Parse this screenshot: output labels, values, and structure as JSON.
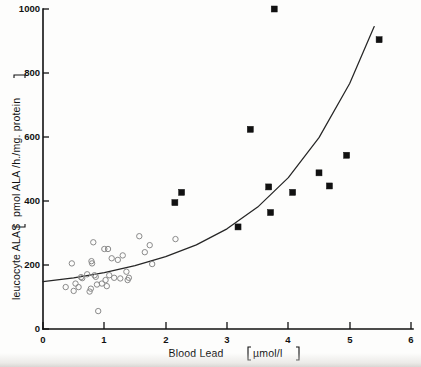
{
  "chart_data": {
    "type": "scatter",
    "title": "",
    "xlabel": "Blood Lead [ µmol/l ]",
    "xlabel_main": "Blood  Lead",
    "xlabel_unit": "µmol/l",
    "ylabel": "leucocyte ALAS [ pmol ALA /h./mg. protein ]",
    "ylabel_main": "leucocyte ALAS",
    "ylabel_unit": "pmol  ALA /h./mg. protein",
    "xlim": [
      0,
      6
    ],
    "ylim": [
      0,
      1000
    ],
    "xticks": [
      0,
      1,
      2,
      3,
      4,
      5,
      6
    ],
    "xticklabels": [
      "0",
      "1",
      "2",
      "3",
      "4",
      "5",
      "6"
    ],
    "yticks": [
      0,
      200,
      400,
      600,
      800,
      1000
    ],
    "yticklabels": [
      "0",
      "200",
      "400",
      "600",
      "800",
      "1000"
    ],
    "grid": false,
    "legend": "none",
    "marker_colors": {
      "open_circle_stroke": "#8a8a8a",
      "filled_square": "#111111",
      "curve": "#262626",
      "axis": "#111111"
    },
    "series": [
      {
        "name": "controls (open circles)",
        "marker": "open-circle",
        "points": [
          [
            0.37,
            131
          ],
          [
            0.47,
            205
          ],
          [
            0.5,
            119
          ],
          [
            0.53,
            142
          ],
          [
            0.58,
            131
          ],
          [
            0.62,
            162
          ],
          [
            0.64,
            159
          ],
          [
            0.72,
            171
          ],
          [
            0.76,
            117
          ],
          [
            0.78,
            126
          ],
          [
            0.79,
            212
          ],
          [
            0.8,
            205
          ],
          [
            0.82,
            271
          ],
          [
            0.84,
            168
          ],
          [
            0.86,
            163
          ],
          [
            0.88,
            139
          ],
          [
            0.9,
            56
          ],
          [
            0.96,
            142
          ],
          [
            1.0,
            250
          ],
          [
            1.02,
            153
          ],
          [
            1.04,
            134
          ],
          [
            1.06,
            250
          ],
          [
            1.08,
            168
          ],
          [
            1.12,
            221
          ],
          [
            1.16,
            160
          ],
          [
            1.22,
            216
          ],
          [
            1.26,
            158
          ],
          [
            1.3,
            230
          ],
          [
            1.36,
            179
          ],
          [
            1.38,
            153
          ],
          [
            1.4,
            160
          ],
          [
            1.57,
            290
          ],
          [
            1.66,
            240
          ],
          [
            1.74,
            262
          ],
          [
            1.78,
            203
          ],
          [
            2.16,
            281
          ]
        ]
      },
      {
        "name": "lead-exposed (filled squares)",
        "marker": "filled-square",
        "points": [
          [
            2.15,
            395
          ],
          [
            2.26,
            427
          ],
          [
            3.18,
            319
          ],
          [
            3.38,
            624
          ],
          [
            3.68,
            444
          ],
          [
            3.71,
            364
          ],
          [
            3.77,
            1000
          ],
          [
            4.07,
            427
          ],
          [
            4.5,
            488
          ],
          [
            4.67,
            447
          ],
          [
            4.95,
            543
          ],
          [
            5.48,
            904
          ]
        ]
      }
    ],
    "fit_curve": {
      "name": "exponential regression",
      "points": [
        [
          0.0,
          148
        ],
        [
          0.5,
          160
        ],
        [
          1.0,
          176
        ],
        [
          1.5,
          198
        ],
        [
          2.0,
          226
        ],
        [
          2.5,
          263
        ],
        [
          3.0,
          313
        ],
        [
          3.5,
          381
        ],
        [
          4.0,
          473
        ],
        [
          4.5,
          598
        ],
        [
          5.0,
          767
        ],
        [
          5.4,
          945
        ]
      ]
    }
  }
}
